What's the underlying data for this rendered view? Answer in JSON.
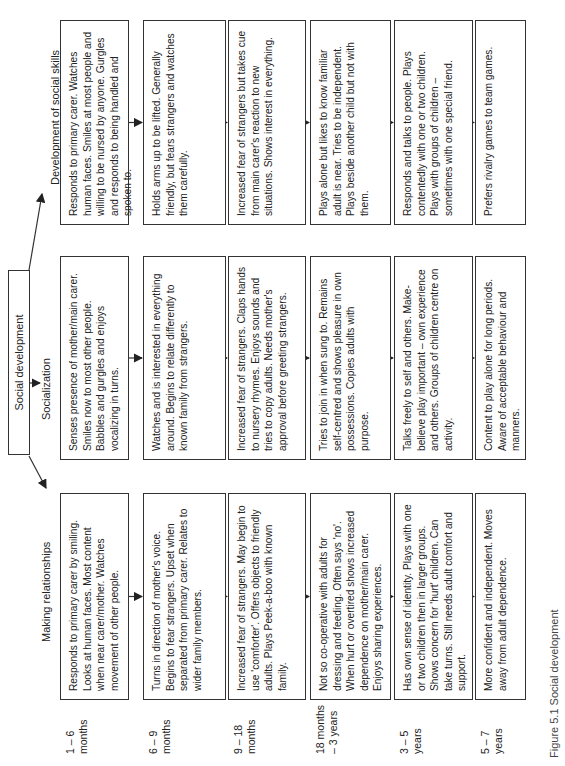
{
  "diagram": {
    "root": "Social development",
    "caption": "Figure 5.1 Social development",
    "columns": [
      {
        "id": "making",
        "header": "Making relationships"
      },
      {
        "id": "socialization",
        "header": "Socialization"
      },
      {
        "id": "social_skills",
        "header": "Development of social skills"
      }
    ],
    "rows": [
      {
        "age": "1 – 6 months",
        "age_line1": "1 – 6",
        "age_line2": "months",
        "making": "Responds to primary carer by smiling. Looks at human faces. Most content when near carer/mother. Watches movement of other people.",
        "socialization": "Senses presence of mother/main carer. Smiles now to most other people. Babbles and gurgles and enjoys vocalizing in turns.",
        "social_skills": "Responds to primary carer. Watches human faces. Smiles at most people and willing to be nursed by anyone. Gurgles and responds to being handled and spoken to."
      },
      {
        "age": "6 – 9 months",
        "age_line1": "6 – 9",
        "age_line2": "months",
        "making": "Turns in direction of mother's voice. Begins to fear strangers. Upset when separated from primary carer. Relates to wider family members.",
        "socialization": "Watches and is interested in everything around. Begins to relate differently to known family from strangers.",
        "social_skills": "Holds arms up to be lifted. Generally friendly, but fears strangers and watches them carefully."
      },
      {
        "age": "9 – 18 months",
        "age_line1": "9 – 18",
        "age_line2": "months",
        "making": "Increased fear of strangers. May begin to use 'comforter'. Offers objects to friendly adults. Plays Peek-a-boo with known family.",
        "socialization": "Increased fear of strangers. Claps hands to nursery rhymes. Enjoys sounds and tries to copy adults. Needs mother's approval before greeting strangers.",
        "social_skills": "Increased fear of strangers but takes cue from main carer's reaction to new situations. Shows interest in everything."
      },
      {
        "age": "18 months – 3 years",
        "age_line1": "18 months",
        "age_line2": "– 3 years",
        "making": "Not so co-operative with adults for dressing and feeding. Often says 'no'. When hurt or overtired shows increased dependence on mother/main carer. Enjoys sharing experiences.",
        "socialization": "Tries to join in when sung to. Remains self-centred and shows pleasure in own possessions. Copies adults with purpose.",
        "social_skills": "Plays alone but likes to know familiar adult is near. Tries to be independent. Plays beside another child but not with them."
      },
      {
        "age": "3 – 5 years",
        "age_line1": "3 – 5",
        "age_line2": "years",
        "making": "Has own sense of identity. Plays with one or two children then in larger groups. Shows concern for 'hurt' children. Can take turns. Still needs adult comfort and support.",
        "socialization": "Talks freely to self and others. Make-believe play important – own experience and others. Groups of children centre on activity.",
        "social_skills": "Responds and talks to people. Plays contentedly with one or two children. Plays with groups of children – sometimes with one special friend."
      },
      {
        "age": "5 – 7 years",
        "age_line1": "5 – 7",
        "age_line2": "years",
        "making": "More confident and independent. Moves away from adult dependence.",
        "socialization": "Content to play alone for long periods. Aware of acceptable behaviour and manners.",
        "social_skills": "Prefers rivalry games to team games."
      }
    ]
  }
}
